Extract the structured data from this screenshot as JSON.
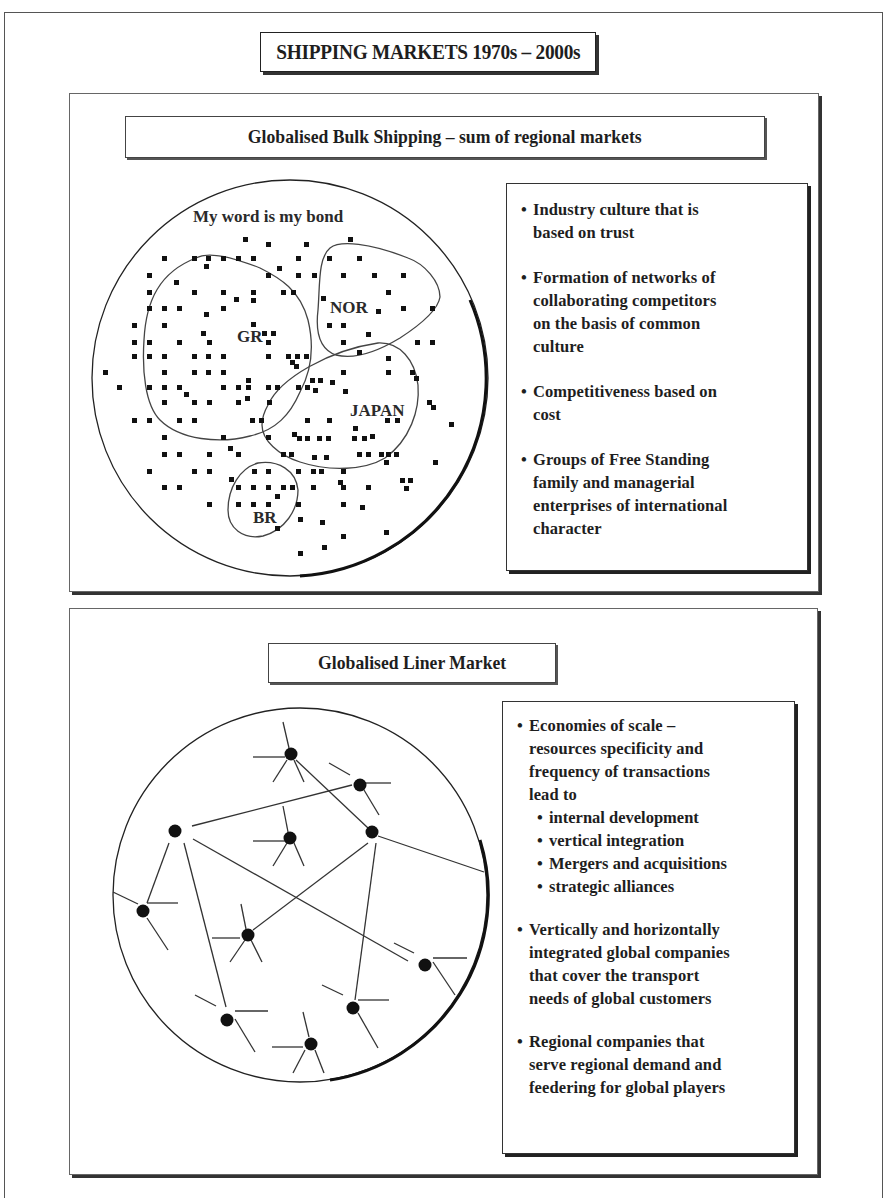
{
  "header": {
    "title": "SHIPPING MARKETS 1970s – 2000s"
  },
  "bulk": {
    "title": "Globalised Bulk Shipping – sum of regional markets",
    "diagram": {
      "caption": "My word is my bond",
      "regions": [
        {
          "id": "gr",
          "label": "GR"
        },
        {
          "id": "nor",
          "label": "NOR"
        },
        {
          "id": "japan",
          "label": "JAPAN"
        },
        {
          "id": "br",
          "label": "BR"
        }
      ]
    },
    "bullets": [
      {
        "text": "Industry culture that is\nbased on trust"
      },
      {
        "text": "Formation of networks of\ncollaborating competitors\non the basis of common\nculture"
      },
      {
        "text": "Competitiveness based on\ncost"
      },
      {
        "text": "Groups of Free Standing\nfamily and managerial\nenterprises of international\ncharacter"
      }
    ]
  },
  "liner": {
    "title": "Globalised Liner Market",
    "bullets": [
      {
        "text": "Economies of scale –\nresources specificity and\nfrequency of transactions\nlead to",
        "sub_items": [
          "internal development",
          "vertical integration",
          "Mergers and acquisitions",
          "strategic alliances"
        ]
      },
      {
        "text": "Vertically and horizontally\nintegrated global companies\nthat cover the transport\nneeds of global customers"
      },
      {
        "text": "Regional companies that\nserve regional demand and\nfeedering for global players"
      }
    ]
  },
  "bullet_glyph": "•"
}
